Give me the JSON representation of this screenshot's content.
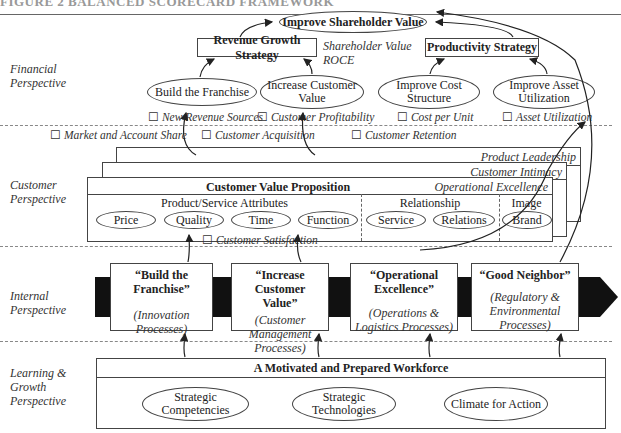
{
  "header": {
    "clipped_title": "FIGURE 2 BALANCED SCORECARD FRAMEWORK"
  },
  "perspectives": {
    "financial": "Financial Perspective",
    "customer": "Customer Perspective",
    "internal": "Internal Perspective",
    "learning": "Learning & Growth Perspective"
  },
  "financial": {
    "top_goal": "Improve Shareholder Value",
    "revenue_strategy": "Revenue Growth Strategy",
    "productivity_strategy": "Productivity Strategy",
    "shareholder_measures": [
      "Shareholder Value",
      "ROCE"
    ],
    "objectives": [
      {
        "label": "Build the Franchise",
        "measure": "New Revenue Sources"
      },
      {
        "label": "Increase Customer Value",
        "measure": "Customer Profitability"
      },
      {
        "label": "Improve Cost Structure",
        "measure": "Cost per Unit"
      },
      {
        "label": "Improve Asset Utilization",
        "measure": "Asset Utilization"
      }
    ]
  },
  "customer": {
    "measures_top": [
      "Market and Account Share",
      "Customer Acquisition",
      "Customer Retention"
    ],
    "stack_labels": [
      "Product Leadership",
      "Customer Intimacy",
      "Operational Excellence"
    ],
    "value_prop_title": "Customer Value Proposition",
    "groups": [
      {
        "title": "Product/Service Attributes",
        "items": [
          "Price",
          "Quality",
          "Time",
          "Function"
        ]
      },
      {
        "title": "Relationship",
        "items": [
          "Service",
          "Relations"
        ]
      },
      {
        "title": "Image",
        "items": [
          "Brand"
        ]
      }
    ],
    "satisfaction_measure": "Customer Satisfaction"
  },
  "internal": {
    "processes": [
      {
        "title": "“Build the Franchise”",
        "sub": "(Innovation Processes)"
      },
      {
        "title": "“Increase Customer Value”",
        "sub": "(Customer Management Processes)"
      },
      {
        "title": "“Operational Excellence”",
        "sub": "(Operations & Logistics Processes)"
      },
      {
        "title": "“Good Neighbor”",
        "sub": "(Regulatory & Environmental Processes)"
      }
    ]
  },
  "learning": {
    "title": "A Motivated and Prepared Workforce",
    "items": [
      "Strategic Competencies",
      "Strategic Technologies",
      "Climate for Action"
    ]
  },
  "colors": {
    "line": "#444444",
    "dash": "#888888",
    "process_bar": "#111111"
  }
}
